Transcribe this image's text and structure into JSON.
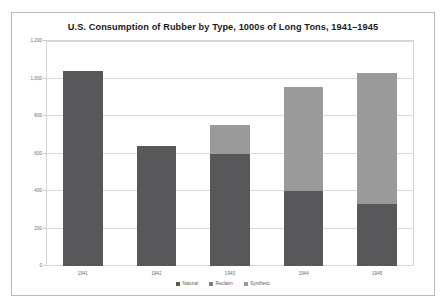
{
  "chart_data": {
    "type": "bar",
    "subtype": "stacked",
    "title": "U.S. Consumption of Rubber by Type, 1000s of Long Tons, 1941–1945",
    "xlabel": "",
    "ylabel": "",
    "categories": [
      "1941",
      "1942",
      "1943",
      "1944",
      "1945"
    ],
    "series": [
      {
        "name": "Natural",
        "color": "#58585a",
        "values": [
          1040,
          640,
          600,
          400,
          330
        ]
      },
      {
        "name": "Reclaim",
        "color": "#7c7c7e",
        "values": [
          0,
          0,
          0,
          0,
          0
        ]
      },
      {
        "name": "Synthetic",
        "color": "#9a9a9a",
        "values": [
          0,
          0,
          150,
          555,
          700
        ]
      }
    ],
    "totals": [
      1040,
      640,
      750,
      955,
      1030
    ],
    "ylim": [
      0,
      1200
    ],
    "yticks": [
      0,
      200,
      400,
      600,
      800,
      1000,
      1200
    ],
    "ytick_labels": [
      "0",
      "200",
      "400",
      "600",
      "800",
      "1,000",
      "1,200"
    ],
    "grid": true,
    "legend_position": "bottom"
  },
  "legend": {
    "items": [
      {
        "label": "Natural",
        "color": "#58585a"
      },
      {
        "label": "Reclaim",
        "color": "#7c7c7e"
      },
      {
        "label": "Synthetic",
        "color": "#9a9a9a"
      }
    ]
  }
}
